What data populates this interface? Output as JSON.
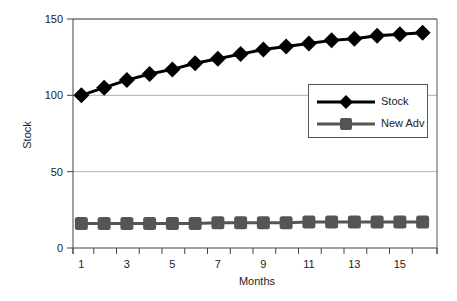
{
  "chart_data": {
    "type": "line",
    "title": "",
    "xlabel": "Months",
    "ylabel": "Stock",
    "x": [
      1,
      2,
      3,
      4,
      5,
      6,
      7,
      8,
      9,
      10,
      11,
      12,
      13,
      14,
      15,
      16
    ],
    "x_tick_labels": [
      "1",
      "3",
      "5",
      "7",
      "9",
      "11",
      "13",
      "15"
    ],
    "y_tick_labels": [
      "0",
      "50",
      "100",
      "150"
    ],
    "ylim": [
      0,
      150
    ],
    "grid": {
      "horizontal": true,
      "vertical": false
    },
    "legend_position": "right-middle, inside plot",
    "series": [
      {
        "name": "Stock",
        "color": "#000000",
        "marker": "diamond",
        "values": [
          100,
          105,
          110,
          114,
          117,
          121,
          124,
          127,
          130,
          132,
          134,
          136,
          137,
          139,
          140,
          141
        ]
      },
      {
        "name": "New Adv",
        "color": "#555555",
        "marker": "square",
        "values": [
          16,
          16,
          16,
          16,
          16,
          16,
          16.5,
          16.5,
          16.5,
          16.5,
          17,
          17,
          17,
          17,
          17,
          17
        ]
      }
    ]
  },
  "legend": {
    "items": [
      {
        "label": "Stock"
      },
      {
        "label": "New Adv"
      }
    ]
  },
  "axes": {
    "xlabel": "Months",
    "ylabel": "Stock"
  }
}
